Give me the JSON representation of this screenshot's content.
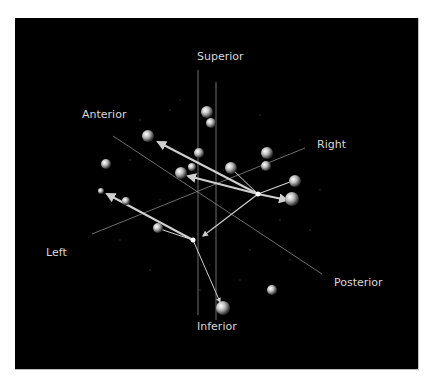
{
  "figure": {
    "background": "#000000",
    "axis_color": "#8a8a8a",
    "arrow_color": "#cfcfcf",
    "sphere_color": "#bfbfbf",
    "labels": {
      "superior": "Superior",
      "inferior": "Inferior",
      "anterior": "Anterior",
      "posterior": "Posterior",
      "left": "Left",
      "right": "Right"
    },
    "hubs": [
      {
        "name": "hub-right",
        "x": 258,
        "y": 194
      },
      {
        "name": "hub-left",
        "x": 193,
        "y": 240
      }
    ],
    "spheres": [
      {
        "x": 207,
        "y": 112,
        "r": 6
      },
      {
        "x": 211,
        "y": 123,
        "r": 5
      },
      {
        "x": 148,
        "y": 136,
        "r": 6
      },
      {
        "x": 199,
        "y": 153,
        "r": 5
      },
      {
        "x": 181,
        "y": 173,
        "r": 6
      },
      {
        "x": 192,
        "y": 167,
        "r": 4
      },
      {
        "x": 231,
        "y": 168,
        "r": 6
      },
      {
        "x": 267,
        "y": 153,
        "r": 6
      },
      {
        "x": 266,
        "y": 166,
        "r": 5
      },
      {
        "x": 295,
        "y": 181,
        "r": 6
      },
      {
        "x": 292,
        "y": 199,
        "r": 7
      },
      {
        "x": 106,
        "y": 164,
        "r": 5
      },
      {
        "x": 101,
        "y": 191,
        "r": 3
      },
      {
        "x": 126,
        "y": 201,
        "r": 4
      },
      {
        "x": 158,
        "y": 228,
        "r": 5
      },
      {
        "x": 272,
        "y": 290,
        "r": 5
      },
      {
        "x": 223,
        "y": 308,
        "r": 7
      }
    ]
  }
}
